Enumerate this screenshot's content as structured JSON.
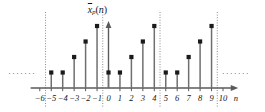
{
  "chart_data": {
    "type": "scatter",
    "plot_style": "stem",
    "title_parts": {
      "base": "x",
      "tilde": true,
      "subscript": "p",
      "arg": "(n)"
    },
    "xlabel": "n",
    "ylabel": "",
    "x": [
      -5,
      -4,
      -3,
      -2,
      -1,
      0,
      1,
      2,
      3,
      4,
      5,
      6,
      7,
      8,
      9
    ],
    "values": [
      1,
      1,
      2,
      3,
      4,
      1,
      1,
      2,
      3,
      4,
      1,
      1,
      2,
      3,
      4
    ],
    "period": 5,
    "base_pattern": [
      1,
      1,
      2,
      3,
      4
    ],
    "xlim": [
      -6.8,
      11.2
    ],
    "ylim": [
      0,
      4.6
    ],
    "xticks": [
      -6,
      -5,
      -4,
      -3,
      -2,
      -1,
      0,
      1,
      2,
      3,
      4,
      5,
      6,
      7,
      8,
      9,
      10
    ],
    "xtick_labels": [
      "−6",
      "−5",
      "−4",
      "−3",
      "−2",
      "−1",
      "0",
      "1",
      "2",
      "3",
      "4",
      "5",
      "6",
      "7",
      "8",
      "9",
      "10"
    ],
    "grid": false,
    "legend": null,
    "period_marker_lines": [
      -5.5,
      -0.5,
      4.5,
      9.5
    ],
    "continuation_left": "·······",
    "continuation_right": "·······",
    "continuation_y": 1.0,
    "colors": {
      "stem": "#6f6f6f",
      "marker": "#1a1a1a",
      "axis": "#5a5a5a",
      "dotted_line": "#8a8a8a",
      "text": "#161616"
    }
  }
}
